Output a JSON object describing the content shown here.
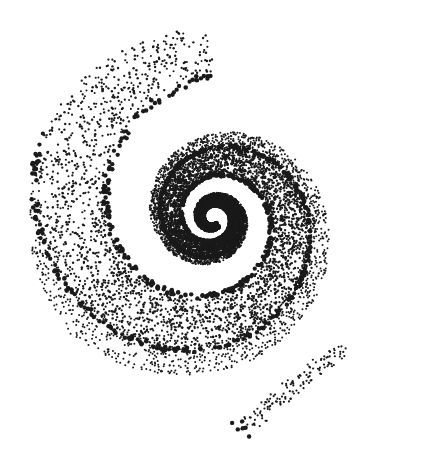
{
  "image": {
    "description": "Stippled dot-art spiral (galaxy-like whorl) in black dots on white background",
    "width": 435,
    "height": 452,
    "background": "#ffffff",
    "dot_color": "#1a1a1a"
  },
  "spiral": {
    "center": [
      213,
      218
    ],
    "arms": 2,
    "turns": 2.6,
    "max_radius": 190,
    "rim_dots_large": true
  }
}
